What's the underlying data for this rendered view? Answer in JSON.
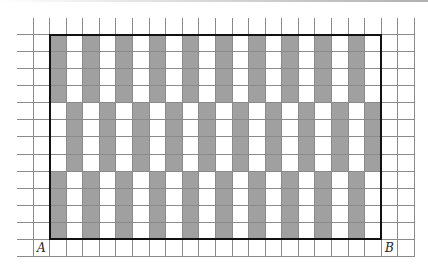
{
  "figure": {
    "grid": {
      "columns": 24,
      "rows": 14,
      "cell_width": 16.58,
      "cell_height": 17.07,
      "line_color": "#8a8a8a"
    },
    "rectangle": {
      "col_start": 2,
      "col_end": 21,
      "row_start": 1,
      "row_end": 12,
      "border_color": "#111111"
    },
    "shading": {
      "color": "#a0a0a0",
      "bands": [
        {
          "row_start": 1,
          "row_end": 4,
          "gray_columns": [
            2,
            4,
            6,
            8,
            10,
            12,
            14,
            16,
            18,
            20
          ]
        },
        {
          "row_start": 5,
          "row_end": 8,
          "gray_columns": [
            3,
            5,
            7,
            9,
            11,
            13,
            15,
            17,
            19,
            21
          ]
        },
        {
          "row_start": 9,
          "row_end": 12,
          "gray_columns": [
            2,
            4,
            6,
            8,
            10,
            12,
            14,
            16,
            18,
            20
          ]
        }
      ]
    },
    "labels": [
      {
        "text": "A",
        "col": 1,
        "row": 13
      },
      {
        "text": "B",
        "col": 22,
        "row": 13
      }
    ]
  }
}
